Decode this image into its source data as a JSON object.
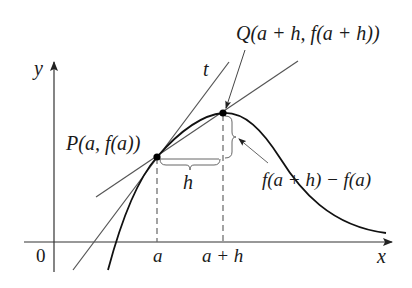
{
  "figure": {
    "axes": {
      "x_label": "x",
      "y_label": "y",
      "origin_label": "0"
    },
    "tick_labels": {
      "a": "a",
      "a_plus_h": "a + h"
    },
    "points": {
      "P": {
        "label": "P(a, f(a))"
      },
      "Q": {
        "label": "Q(a + h, f(a + h))"
      }
    },
    "lines": {
      "tangent_label": "t"
    },
    "annotations": {
      "horizontal_increment": "h",
      "vertical_increment": "f(a + h) − f(a)"
    },
    "colors": {
      "curve": "#111111",
      "tangent": "#555555",
      "secant": "#555555",
      "axes": "#333333",
      "dashed": "#666666"
    }
  }
}
